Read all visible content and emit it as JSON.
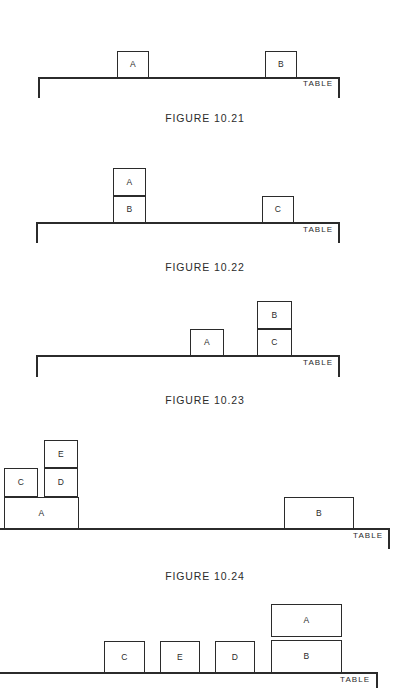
{
  "document": {
    "kind": "textbook-figure-sheet",
    "table_label": "TABLE"
  },
  "figures": [
    {
      "caption": "FIGURE 10.21",
      "caption_y": 113,
      "table": {
        "x": 38,
        "y": 77,
        "width": 302,
        "leg_height": 21,
        "label_x": 303,
        "label_y": 80
      },
      "blocks": [
        {
          "id": "A",
          "label": "A",
          "x": 117,
          "y": 51,
          "w": 32,
          "h": 27
        },
        {
          "id": "B",
          "label": "B",
          "x": 265,
          "y": 51,
          "w": 32,
          "h": 27
        }
      ]
    },
    {
      "caption": "FIGURE 10.22",
      "caption_y": 262,
      "table": {
        "x": 36,
        "y": 222,
        "width": 304,
        "leg_height": 21,
        "label_x": 303,
        "label_y": 226
      },
      "blocks": [
        {
          "id": "A",
          "label": "A",
          "x": 113,
          "y": 168,
          "w": 33,
          "h": 28
        },
        {
          "id": "B",
          "label": "B",
          "x": 113,
          "y": 196,
          "w": 33,
          "h": 27
        },
        {
          "id": "C",
          "label": "C",
          "x": 262,
          "y": 196,
          "w": 32,
          "h": 27
        }
      ]
    },
    {
      "caption": "FIGURE 10.23",
      "caption_y": 395,
      "table": {
        "x": 36,
        "y": 355,
        "width": 304,
        "leg_height": 22,
        "label_x": 303,
        "label_y": 359
      },
      "blocks": [
        {
          "id": "A",
          "label": "A",
          "x": 190,
          "y": 329,
          "w": 34,
          "h": 27
        },
        {
          "id": "B",
          "label": "B",
          "x": 257,
          "y": 301,
          "w": 35,
          "h": 28
        },
        {
          "id": "C",
          "label": "C",
          "x": 257,
          "y": 329,
          "w": 35,
          "h": 27
        }
      ]
    },
    {
      "caption": "FIGURE 10.24",
      "caption_y": 571,
      "table": {
        "x": 0,
        "y": 528,
        "width": 390,
        "leg_height": 21,
        "label_x": 353,
        "label_y": 532
      },
      "blocks": [
        {
          "id": "A",
          "label": "A",
          "x": 4,
          "y": 497,
          "w": 75,
          "h": 32
        },
        {
          "id": "C",
          "label": "C",
          "x": 4,
          "y": 468,
          "w": 34,
          "h": 29
        },
        {
          "id": "D",
          "label": "D",
          "x": 44,
          "y": 468,
          "w": 34,
          "h": 29
        },
        {
          "id": "E",
          "label": "E",
          "x": 44,
          "y": 440,
          "w": 34,
          "h": 28
        },
        {
          "id": "B",
          "label": "B",
          "x": 284,
          "y": 497,
          "w": 70,
          "h": 32
        }
      ]
    },
    {
      "caption": "",
      "caption_y": -1,
      "table": {
        "x": 0,
        "y": 672,
        "width": 378,
        "leg_height": 16,
        "label_x": 340,
        "label_y": 676
      },
      "blocks": [
        {
          "id": "C",
          "label": "C",
          "x": 104,
          "y": 641,
          "w": 41,
          "h": 32
        },
        {
          "id": "E",
          "label": "E",
          "x": 160,
          "y": 641,
          "w": 40,
          "h": 32
        },
        {
          "id": "D",
          "label": "D",
          "x": 215,
          "y": 641,
          "w": 40,
          "h": 32
        },
        {
          "id": "A",
          "label": "A",
          "x": 271,
          "y": 604,
          "w": 71,
          "h": 33
        },
        {
          "id": "B",
          "label": "B",
          "x": 271,
          "y": 640,
          "w": 71,
          "h": 33
        }
      ]
    }
  ]
}
